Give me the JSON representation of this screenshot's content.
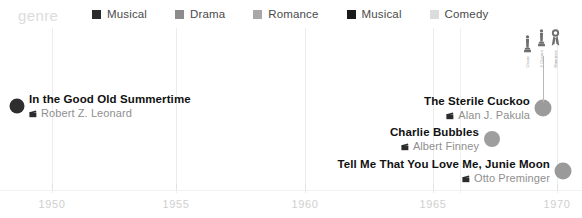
{
  "legend": {
    "title": "genre",
    "items": [
      {
        "label": "Musical",
        "color": "#2b2b2b"
      },
      {
        "label": "Drama",
        "color": "#8c8c8c"
      },
      {
        "label": "Romance",
        "color": "#a8a8a8"
      },
      {
        "label": "Musical",
        "color": "#1a1a1a"
      },
      {
        "label": "Comedy",
        "color": "#dcdcdc"
      }
    ]
  },
  "axis": {
    "ticks": [
      {
        "label": "1950",
        "x": 52
      },
      {
        "label": "1955",
        "x": 176
      },
      {
        "label": "1960",
        "x": 305
      },
      {
        "label": "1965",
        "x": 433
      },
      {
        "label": "1970",
        "x": 557
      }
    ],
    "gridlines": [
      52,
      176,
      305,
      433,
      460,
      557
    ]
  },
  "entries": [
    {
      "title": "In the Good Old Summertime",
      "director": "Robert Z. Leonard",
      "dot": {
        "x": 17,
        "y": 106,
        "size": 15,
        "color": "#2e2e2e"
      },
      "label": {
        "x": 29,
        "y": 106,
        "align": "left"
      }
    },
    {
      "title": "The Sterile Cuckoo",
      "director": "Alan J. Pakula",
      "dot": {
        "x": 543,
        "y": 108,
        "size": 17,
        "color": "#9b9b9b"
      },
      "label": {
        "x": 530,
        "y": 108,
        "align": "right"
      },
      "awards": {
        "stem": {
          "x": 543,
          "top": 56,
          "height": 46
        },
        "items": [
          {
            "icon": "oscar-statuette",
            "label": "Oscar"
          },
          {
            "icon": "oscar-statuette",
            "label": "2 Oscars"
          },
          {
            "icon": "award-ribbon",
            "label": "Nominee"
          }
        ]
      }
    },
    {
      "title": "Charlie Bubbles",
      "director": "Albert Finney",
      "dot": {
        "x": 492,
        "y": 139,
        "size": 16,
        "color": "#9e9e9e"
      },
      "label": {
        "x": 479,
        "y": 139,
        "align": "right"
      }
    },
    {
      "title": "Tell Me That You Love Me, Junie Moon",
      "director": "Otto Preminger",
      "dot": {
        "x": 563,
        "y": 171,
        "size": 17,
        "color": "#9a9a9a"
      },
      "label": {
        "x": 550,
        "y": 171,
        "align": "right"
      }
    }
  ]
}
